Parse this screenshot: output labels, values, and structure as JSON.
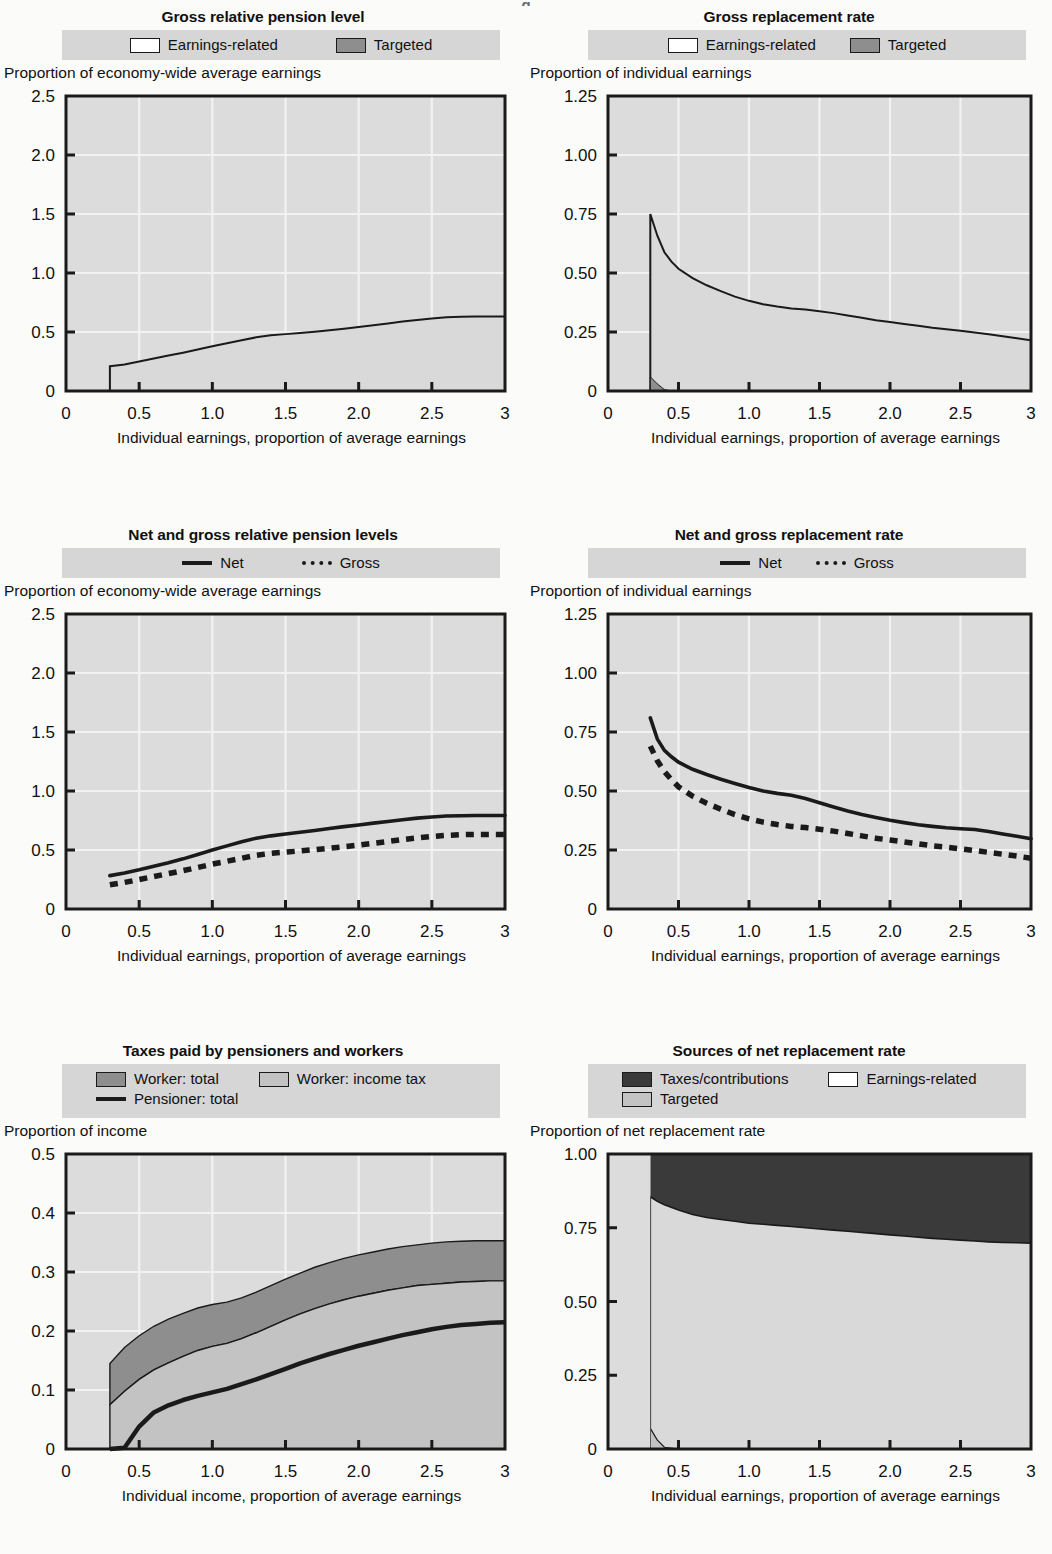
{
  "page": {
    "top_fragment": "g"
  },
  "colors": {
    "plot_bg": "#d4d4d4",
    "plot_bg_light": "#dcdcdc",
    "grid": "#f2f2f2",
    "axis": "#1a1a1a",
    "legend_band": "#d6d6d6",
    "earnings_related": "#d9d9d9",
    "targeted": "#8e8e8e",
    "worker_total": "#8e8e8e",
    "worker_income_tax": "#c3c3c3",
    "taxes_contributions": "#3a3a3a",
    "line": "#1a1a1a"
  },
  "panels": [
    {
      "id": "gross-relative-pension-level",
      "title": "Gross relative pension level",
      "ylabel": "Proportion of economy-wide average earnings",
      "legend": [
        [
          {
            "label": "Earnings-related",
            "type": "swatch",
            "fill": "#ffffff"
          },
          {
            "label": "Targeted",
            "type": "swatch",
            "fill": "#8e8e8e"
          }
        ]
      ]
    },
    {
      "id": "gross-replacement-rate",
      "title": "Gross replacement rate",
      "ylabel": "Proportion of individual earnings",
      "legend": [
        [
          {
            "label": "Earnings-related",
            "type": "swatch",
            "fill": "#ffffff"
          },
          {
            "label": "Targeted",
            "type": "swatch",
            "fill": "#8e8e8e"
          }
        ]
      ]
    },
    {
      "id": "net-and-gross-relative-pension-levels",
      "title": "Net and gross relative pension levels",
      "ylabel": "Proportion of economy-wide average earnings",
      "legend": [
        [
          {
            "label": "Net",
            "type": "line"
          },
          {
            "label": "Gross",
            "type": "dash"
          }
        ]
      ]
    },
    {
      "id": "net-and-gross-replacement-rate",
      "title": "Net and gross replacement rate",
      "ylabel": "Proportion of individual earnings",
      "legend": [
        [
          {
            "label": "Net",
            "type": "line"
          },
          {
            "label": "Gross",
            "type": "dash"
          }
        ]
      ]
    },
    {
      "id": "taxes-paid-by-pensioners-and-workers",
      "title": "Taxes paid by pensioners and workers",
      "ylabel": "Proportion of income",
      "legend": [
        [
          {
            "label": "Worker: total",
            "type": "swatch",
            "fill": "#8e8e8e"
          },
          {
            "label": "Worker: income tax",
            "type": "swatch",
            "fill": "#c3c3c3"
          }
        ],
        [
          {
            "label": "Pensioner: total",
            "type": "line"
          }
        ]
      ]
    },
    {
      "id": "sources-of-net-replacement-rate",
      "title": "Sources of net replacement rate",
      "ylabel": "Proportion of net replacement rate",
      "legend": [
        [
          {
            "label": "Taxes/contributions",
            "type": "swatch",
            "fill": "#3a3a3a"
          },
          {
            "label": "Earnings-related",
            "type": "swatch",
            "fill": "#ffffff"
          }
        ],
        [
          {
            "label": "Targeted",
            "type": "swatch",
            "fill": "#c3c3c3"
          }
        ]
      ]
    }
  ],
  "chart_data": [
    {
      "type": "area",
      "id": "gross-relative-pension-level",
      "title": "Gross relative pension level",
      "xlabel": "Individual earnings, proportion of average earnings",
      "ylabel": "Proportion of economy-wide average earnings",
      "xlim": [
        0,
        3
      ],
      "ylim": [
        0,
        2.5
      ],
      "xticks": [
        0,
        0.5,
        1.0,
        1.5,
        2.0,
        2.5,
        3
      ],
      "xticklabels": [
        "0",
        "0.5",
        "1.0",
        "1.5",
        "2.0",
        "2.5",
        "3"
      ],
      "yticks": [
        0,
        0.5,
        1.0,
        1.5,
        2.0,
        2.5
      ],
      "yticklabels": [
        "0",
        "0.5",
        "1.0",
        "1.5",
        "2.0",
        "2.5"
      ],
      "grid": true,
      "legend_position": "top",
      "x": [
        0.3,
        0.4,
        0.5,
        0.6,
        0.7,
        0.8,
        0.9,
        1.0,
        1.1,
        1.2,
        1.3,
        1.4,
        1.5,
        1.6,
        1.7,
        1.8,
        1.9,
        2.0,
        2.1,
        2.2,
        2.3,
        2.4,
        2.5,
        2.6,
        2.7,
        2.8,
        2.9,
        3.0
      ],
      "series": [
        {
          "name": "Earnings-related",
          "values": [
            0.205,
            0.225,
            0.25,
            0.275,
            0.3,
            0.325,
            0.352,
            0.38,
            0.405,
            0.43,
            0.455,
            0.472,
            0.482,
            0.492,
            0.503,
            0.515,
            0.528,
            0.542,
            0.557,
            0.572,
            0.588,
            0.602,
            0.614,
            0.624,
            0.63,
            0.632,
            0.632,
            0.632
          ]
        },
        {
          "name": "Targeted",
          "values": [
            0.005,
            0,
            0,
            0,
            0,
            0,
            0,
            0,
            0,
            0,
            0,
            0,
            0,
            0,
            0,
            0,
            0,
            0,
            0,
            0,
            0,
            0,
            0,
            0,
            0,
            0,
            0,
            0
          ]
        }
      ]
    },
    {
      "type": "area",
      "id": "gross-replacement-rate",
      "title": "Gross replacement rate",
      "xlabel": "Individual earnings, proportion of average earnings",
      "ylabel": "Proportion of individual earnings",
      "xlim": [
        0,
        3
      ],
      "ylim": [
        0,
        1.25
      ],
      "xticks": [
        0,
        0.5,
        1.0,
        1.5,
        2.0,
        2.5,
        3
      ],
      "xticklabels": [
        "0",
        "0.5",
        "1.0",
        "1.5",
        "2.0",
        "2.5",
        "3"
      ],
      "yticks": [
        0,
        0.25,
        0.5,
        0.75,
        1.0,
        1.25
      ],
      "yticklabels": [
        "0",
        "0.25",
        "0.50",
        "0.75",
        "1.00",
        "1.25"
      ],
      "grid": true,
      "legend_position": "top",
      "x": [
        0.3,
        0.35,
        0.4,
        0.45,
        0.5,
        0.6,
        0.7,
        0.8,
        0.9,
        1.0,
        1.1,
        1.2,
        1.3,
        1.4,
        1.5,
        1.6,
        1.7,
        1.8,
        1.9,
        2.0,
        2.1,
        2.2,
        2.3,
        2.4,
        2.5,
        2.6,
        2.7,
        2.8,
        2.9,
        3.0
      ],
      "series": [
        {
          "name": "Earnings-related",
          "values": [
            0.69,
            0.628,
            0.582,
            0.548,
            0.518,
            0.478,
            0.448,
            0.423,
            0.4,
            0.382,
            0.368,
            0.358,
            0.35,
            0.345,
            0.338,
            0.33,
            0.32,
            0.31,
            0.3,
            0.292,
            0.284,
            0.276,
            0.268,
            0.262,
            0.255,
            0.248,
            0.24,
            0.232,
            0.224,
            0.215
          ]
        },
        {
          "name": "Targeted",
          "values": [
            0.06,
            0.03,
            0.006,
            0.0,
            0,
            0,
            0,
            0,
            0,
            0,
            0,
            0,
            0,
            0,
            0,
            0,
            0,
            0,
            0,
            0,
            0,
            0,
            0,
            0,
            0,
            0,
            0,
            0,
            0,
            0
          ]
        }
      ]
    },
    {
      "type": "line",
      "id": "net-and-gross-relative-pension-levels",
      "title": "Net and gross relative pension levels",
      "xlabel": "Individual earnings, proportion of average earnings",
      "ylabel": "Proportion of economy-wide average earnings",
      "xlim": [
        0,
        3
      ],
      "ylim": [
        0,
        2.5
      ],
      "xticks": [
        0,
        0.5,
        1.0,
        1.5,
        2.0,
        2.5,
        3
      ],
      "xticklabels": [
        "0",
        "0.5",
        "1.0",
        "1.5",
        "2.0",
        "2.5",
        "3"
      ],
      "yticks": [
        0,
        0.5,
        1.0,
        1.5,
        2.0,
        2.5
      ],
      "yticklabels": [
        "0",
        "0.5",
        "1.0",
        "1.5",
        "2.0",
        "2.5"
      ],
      "grid": true,
      "legend_position": "top",
      "x": [
        0.3,
        0.4,
        0.5,
        0.6,
        0.7,
        0.8,
        0.9,
        1.0,
        1.1,
        1.2,
        1.3,
        1.4,
        1.5,
        1.6,
        1.7,
        1.8,
        1.9,
        2.0,
        2.1,
        2.2,
        2.3,
        2.4,
        2.5,
        2.6,
        2.7,
        2.8,
        2.9,
        3.0
      ],
      "series": [
        {
          "name": "Net",
          "style": "solid",
          "values": [
            0.283,
            0.305,
            0.332,
            0.362,
            0.392,
            0.425,
            0.462,
            0.5,
            0.535,
            0.57,
            0.6,
            0.62,
            0.635,
            0.65,
            0.665,
            0.682,
            0.698,
            0.712,
            0.728,
            0.742,
            0.757,
            0.77,
            0.78,
            0.788,
            0.79,
            0.792,
            0.792,
            0.792
          ]
        },
        {
          "name": "Gross",
          "style": "dashed",
          "values": [
            0.205,
            0.225,
            0.25,
            0.275,
            0.3,
            0.325,
            0.352,
            0.38,
            0.405,
            0.43,
            0.455,
            0.472,
            0.482,
            0.492,
            0.503,
            0.515,
            0.528,
            0.542,
            0.557,
            0.572,
            0.588,
            0.602,
            0.614,
            0.624,
            0.63,
            0.632,
            0.632,
            0.632
          ]
        }
      ]
    },
    {
      "type": "line",
      "id": "net-and-gross-replacement-rate",
      "title": "Net and gross replacement rate",
      "xlabel": "Individual earnings, proportion of average earnings",
      "ylabel": "Proportion of individual earnings",
      "xlim": [
        0,
        3
      ],
      "ylim": [
        0,
        1.25
      ],
      "xticks": [
        0,
        0.5,
        1.0,
        1.5,
        2.0,
        2.5,
        3
      ],
      "xticklabels": [
        "0",
        "0.5",
        "1.0",
        "1.5",
        "2.0",
        "2.5",
        "3"
      ],
      "yticks": [
        0,
        0.25,
        0.5,
        0.75,
        1.0,
        1.25
      ],
      "yticklabels": [
        "0",
        "0.25",
        "0.50",
        "0.75",
        "1.00",
        "1.25"
      ],
      "grid": true,
      "legend_position": "top",
      "x": [
        0.3,
        0.35,
        0.4,
        0.45,
        0.5,
        0.6,
        0.7,
        0.8,
        0.9,
        1.0,
        1.1,
        1.2,
        1.3,
        1.4,
        1.5,
        1.6,
        1.7,
        1.8,
        1.9,
        2.0,
        2.1,
        2.2,
        2.3,
        2.4,
        2.5,
        2.6,
        2.7,
        2.8,
        2.9,
        3.0
      ],
      "series": [
        {
          "name": "Net",
          "style": "solid",
          "values": [
            0.81,
            0.72,
            0.672,
            0.645,
            0.622,
            0.592,
            0.57,
            0.55,
            0.532,
            0.515,
            0.5,
            0.49,
            0.482,
            0.468,
            0.45,
            0.432,
            0.415,
            0.4,
            0.388,
            0.376,
            0.366,
            0.357,
            0.35,
            0.344,
            0.34,
            0.337,
            0.328,
            0.318,
            0.308,
            0.298
          ]
        },
        {
          "name": "Gross",
          "style": "dashed",
          "values": [
            0.69,
            0.628,
            0.582,
            0.548,
            0.518,
            0.478,
            0.448,
            0.423,
            0.4,
            0.382,
            0.368,
            0.358,
            0.35,
            0.345,
            0.338,
            0.33,
            0.32,
            0.31,
            0.3,
            0.292,
            0.284,
            0.276,
            0.268,
            0.262,
            0.255,
            0.248,
            0.24,
            0.232,
            0.224,
            0.215
          ]
        }
      ]
    },
    {
      "type": "area",
      "id": "taxes-paid-by-pensioners-and-workers",
      "title": "Taxes paid by pensioners and workers",
      "xlabel": "Individual income, proportion of average earnings",
      "ylabel": "Proportion of income",
      "xlim": [
        0,
        3
      ],
      "ylim": [
        0,
        0.5
      ],
      "xticks": [
        0,
        0.5,
        1.0,
        1.5,
        2.0,
        2.5,
        3
      ],
      "xticklabels": [
        "0",
        "0.5",
        "1.0",
        "1.5",
        "2.0",
        "2.5",
        "3"
      ],
      "yticks": [
        0,
        0.1,
        0.2,
        0.3,
        0.4,
        0.5
      ],
      "yticklabels": [
        "0",
        "0.1",
        "0.2",
        "0.3",
        "0.4",
        "0.5"
      ],
      "grid": true,
      "legend_position": "top",
      "x": [
        0.3,
        0.4,
        0.5,
        0.6,
        0.7,
        0.8,
        0.9,
        1.0,
        1.1,
        1.2,
        1.3,
        1.4,
        1.5,
        1.6,
        1.7,
        1.8,
        1.9,
        2.0,
        2.1,
        2.2,
        2.3,
        2.4,
        2.5,
        2.6,
        2.7,
        2.8,
        2.9,
        3.0
      ],
      "series": [
        {
          "name": "Worker: total",
          "values": [
            0.145,
            0.172,
            0.192,
            0.208,
            0.22,
            0.23,
            0.239,
            0.245,
            0.249,
            0.256,
            0.266,
            0.277,
            0.288,
            0.298,
            0.308,
            0.316,
            0.323,
            0.329,
            0.334,
            0.339,
            0.343,
            0.346,
            0.349,
            0.351,
            0.352,
            0.353,
            0.353,
            0.353
          ]
        },
        {
          "name": "Worker: income tax",
          "values": [
            0.075,
            0.098,
            0.118,
            0.134,
            0.146,
            0.157,
            0.167,
            0.174,
            0.179,
            0.187,
            0.197,
            0.208,
            0.219,
            0.229,
            0.238,
            0.246,
            0.253,
            0.259,
            0.264,
            0.269,
            0.273,
            0.277,
            0.279,
            0.281,
            0.283,
            0.284,
            0.285,
            0.285
          ]
        },
        {
          "name": "Pensioner: total",
          "style": "solid-line",
          "values": [
            0.0,
            0.002,
            0.038,
            0.062,
            0.074,
            0.083,
            0.09,
            0.096,
            0.102,
            0.11,
            0.118,
            0.127,
            0.136,
            0.145,
            0.153,
            0.161,
            0.168,
            0.175,
            0.181,
            0.187,
            0.193,
            0.198,
            0.203,
            0.207,
            0.21,
            0.212,
            0.214,
            0.215
          ]
        }
      ]
    },
    {
      "type": "area",
      "id": "sources-of-net-replacement-rate",
      "title": "Sources of net replacement rate",
      "xlabel": "Individual earnings, proportion of average earnings",
      "ylabel": "Proportion of net replacement rate",
      "xlim": [
        0,
        3
      ],
      "ylim": [
        0,
        1.0
      ],
      "xticks": [
        0,
        0.5,
        1.0,
        1.5,
        2.0,
        2.5,
        3
      ],
      "xticklabels": [
        "0",
        "0.5",
        "1.0",
        "1.5",
        "2.0",
        "2.5",
        "3"
      ],
      "yticks": [
        0,
        0.25,
        0.5,
        0.75,
        1.0
      ],
      "yticklabels": [
        "0",
        "0.25",
        "0.50",
        "0.75",
        "1.00"
      ],
      "grid": true,
      "legend_position": "top",
      "x": [
        0.3,
        0.35,
        0.4,
        0.5,
        0.6,
        0.7,
        0.8,
        0.9,
        1.0,
        1.1,
        1.2,
        1.3,
        1.4,
        1.5,
        1.6,
        1.7,
        1.8,
        1.9,
        2.0,
        2.1,
        2.2,
        2.3,
        2.4,
        2.5,
        2.6,
        2.7,
        2.8,
        2.9,
        3.0
      ],
      "series": [
        {
          "name": "Earnings-related",
          "values": [
            0.855,
            0.84,
            0.828,
            0.81,
            0.795,
            0.785,
            0.778,
            0.772,
            0.765,
            0.762,
            0.758,
            0.754,
            0.75,
            0.746,
            0.742,
            0.738,
            0.734,
            0.73,
            0.726,
            0.722,
            0.718,
            0.714,
            0.711,
            0.708,
            0.705,
            0.702,
            0.7,
            0.699,
            0.698
          ]
        },
        {
          "name": "Targeted",
          "values": [
            0.07,
            0.03,
            0.006,
            0.0,
            0,
            0,
            0,
            0,
            0,
            0,
            0,
            0,
            0,
            0,
            0,
            0,
            0,
            0,
            0,
            0,
            0,
            0,
            0,
            0,
            0,
            0,
            0,
            0,
            0
          ]
        },
        {
          "name": "Taxes/contributions",
          "values": [
            0.145,
            0.16,
            0.172,
            0.19,
            0.205,
            0.215,
            0.222,
            0.228,
            0.235,
            0.238,
            0.242,
            0.246,
            0.25,
            0.254,
            0.258,
            0.262,
            0.266,
            0.27,
            0.274,
            0.278,
            0.282,
            0.286,
            0.289,
            0.292,
            0.295,
            0.298,
            0.3,
            0.301,
            0.302
          ]
        }
      ]
    }
  ]
}
